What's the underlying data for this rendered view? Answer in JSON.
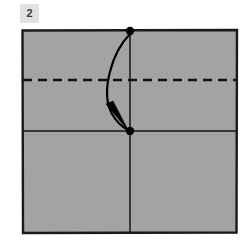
{
  "diagram": {
    "kind": "origami-fold-step",
    "step_label": "2",
    "canvas": {
      "width": 248,
      "height": 247,
      "background": "#ffffff"
    },
    "paper": {
      "name": "square-sheet",
      "shape": "square",
      "fill_color": "#a3a3a3",
      "outline_color": "#1a1a1a",
      "left": 22,
      "top": 30,
      "right": 237,
      "bottom": 233
    },
    "creases": [
      {
        "name": "existing-horizontal-crease",
        "style": "solid",
        "orientation": "horizontal",
        "color": "#151515",
        "y": 131,
        "x_start": 23,
        "x_end": 236
      },
      {
        "name": "existing-vertical-crease",
        "style": "solid",
        "orientation": "vertical",
        "color": "#151515",
        "x": 130,
        "y_start": 31,
        "y_end": 232
      }
    ],
    "fold_lines": [
      {
        "name": "valley-fold-line",
        "style": "dashed",
        "orientation": "horizontal",
        "color": "#111111",
        "y": 80,
        "x_start": 23,
        "x_end": 236,
        "dash_pattern": "9 6"
      }
    ],
    "reference_points": [
      {
        "name": "top-edge-midpoint-dot",
        "cx": 130,
        "cy": 31,
        "r": 4.2,
        "color": "#000000"
      },
      {
        "name": "center-point-dot",
        "cx": 130,
        "cy": 131,
        "r": 4.2,
        "color": "#000000"
      }
    ],
    "arrow": {
      "name": "fold-direction-arrow",
      "color": "#000000",
      "from_point": "top-edge-midpoint-dot",
      "to_point": "center-point-dot",
      "curve": "bulges-left",
      "path": "M 130 34 C 112 52, 100 92, 112 114 C 118 124, 124 128, 128 130",
      "head": "M 128.8 131.4 L 106 104 L 113 101 Z"
    }
  }
}
